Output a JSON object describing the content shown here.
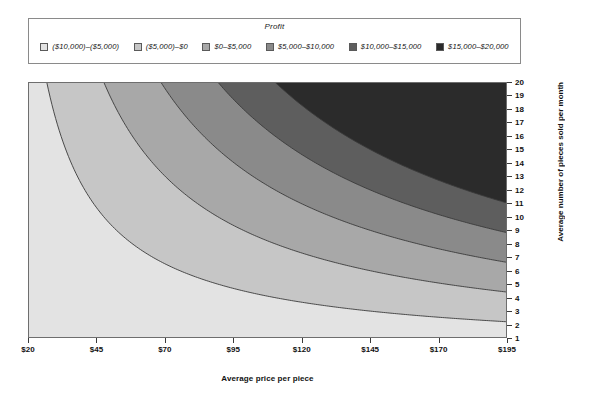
{
  "legend": {
    "title": "Profit",
    "items": [
      {
        "label": "($10,000)–($5,000)",
        "color": "#e3e3e3"
      },
      {
        "label": "($5,000)–$0",
        "color": "#c6c6c6"
      },
      {
        "label": "$0–$5,000",
        "color": "#a8a8a8"
      },
      {
        "label": "$5,000–$10,000",
        "color": "#8a8a8a"
      },
      {
        "label": "$10,000–$15,000",
        "color": "#5e5e5e"
      },
      {
        "label": "$15,000–$20,000",
        "color": "#2b2b2b"
      }
    ]
  },
  "chart_data": {
    "type": "heatmap",
    "title": "Profit",
    "xlabel": "Average price per piece",
    "ylabel": "Average number of pieces sold per month",
    "xlim": [
      20,
      195
    ],
    "ylim": [
      1,
      20
    ],
    "xticks": [
      20,
      45,
      70,
      95,
      120,
      145,
      170,
      195
    ],
    "xtick_labels": [
      "$20",
      "$45",
      "$70",
      "$95",
      "$120",
      "$145",
      "$170",
      "$195"
    ],
    "yticks": [
      1,
      2,
      3,
      4,
      5,
      6,
      7,
      8,
      9,
      10,
      11,
      12,
      13,
      14,
      15,
      16,
      17,
      18,
      19,
      20
    ],
    "ytick_labels": [
      "1",
      "2",
      "3",
      "4",
      "5",
      "6",
      "7",
      "8",
      "9",
      "10",
      "11",
      "12",
      "13",
      "14",
      "15",
      "16",
      "17",
      "18",
      "19",
      "20"
    ],
    "grid": false,
    "legend_position": "top",
    "z_function": "profit = (price - variable_cost) * quantity * months - fixed_cost",
    "model": {
      "variable_cost": 6,
      "margin_scale": 12,
      "fixed_cost": 10000
    },
    "contour_levels": [
      -5000,
      0,
      5000,
      10000,
      15000
    ],
    "bands": [
      {
        "range": [
          -10000,
          -5000
        ],
        "label": "($10,000)–($5,000)",
        "color": "#e3e3e3"
      },
      {
        "range": [
          -5000,
          0
        ],
        "label": "($5,000)–$0",
        "color": "#c6c6c6"
      },
      {
        "range": [
          0,
          5000
        ],
        "label": "$0–$5,000",
        "color": "#a8a8a8"
      },
      {
        "range": [
          5000,
          10000
        ],
        "label": "$5,000–$10,000",
        "color": "#8a8a8a"
      },
      {
        "range": [
          10000,
          15000
        ],
        "label": "$10,000–$15,000",
        "color": "#5e5e5e"
      },
      {
        "range": [
          15000,
          20000
        ],
        "label": "$15,000–$20,000",
        "color": "#2b2b2b"
      }
    ],
    "contour_points": {
      "-5000": [
        [
          20,
          18.0
        ],
        [
          25,
          10.7
        ],
        [
          30,
          7.6
        ],
        [
          35,
          6.0
        ],
        [
          45,
          4.3
        ],
        [
          55,
          3.4
        ],
        [
          70,
          2.6
        ],
        [
          95,
          1.9
        ],
        [
          120,
          1.5
        ],
        [
          145,
          1.2
        ],
        [
          170,
          1.05
        ],
        [
          195,
          0.9
        ]
      ],
      "0": [
        [
          27,
          20.5
        ],
        [
          35,
          11.8
        ],
        [
          45,
          8.2
        ],
        [
          55,
          6.4
        ],
        [
          70,
          4.9
        ],
        [
          95,
          3.6
        ],
        [
          120,
          2.9
        ],
        [
          145,
          2.4
        ],
        [
          170,
          2.05
        ],
        [
          195,
          1.8
        ]
      ],
      "5000": [
        [
          40,
          20.5
        ],
        [
          55,
          12.3
        ],
        [
          70,
          9.4
        ],
        [
          95,
          6.9
        ],
        [
          120,
          5.5
        ],
        [
          145,
          4.6
        ],
        [
          170,
          3.9
        ],
        [
          195,
          3.5
        ]
      ],
      "10000": [
        [
          62,
          20.5
        ],
        [
          80,
          13.5
        ],
        [
          95,
          11.1
        ],
        [
          120,
          8.7
        ],
        [
          145,
          7.2
        ],
        [
          170,
          6.2
        ],
        [
          195,
          5.4
        ]
      ],
      "15000": [
        [
          95,
          20.5
        ],
        [
          120,
          14.4
        ],
        [
          145,
          11.9
        ],
        [
          170,
          10.1
        ],
        [
          195,
          8.8
        ]
      ]
    }
  },
  "style": {
    "plot_border": "#6e6e6e",
    "contour_line": "#3a3a3a",
    "axis_color": "#3a3a3a"
  }
}
